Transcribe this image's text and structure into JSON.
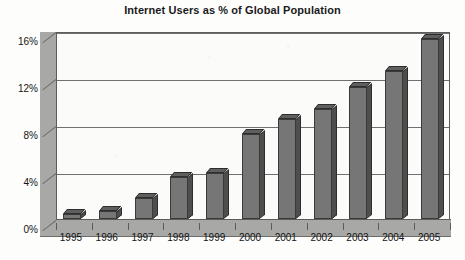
{
  "chart_data": {
    "type": "bar",
    "title": "Internet Users as % of Global Population",
    "xlabel": "",
    "ylabel": "",
    "categories": [
      "1995",
      "1996",
      "1997",
      "1998",
      "1999",
      "2000",
      "2001",
      "2002",
      "2003",
      "2004",
      "2005"
    ],
    "values": [
      0.4,
      0.7,
      1.8,
      3.6,
      3.9,
      7.2,
      8.5,
      9.4,
      11.2,
      12.6,
      15.3
    ],
    "ylim": [
      0,
      16
    ],
    "yticks": [
      0,
      4,
      8,
      12,
      16
    ],
    "ytick_labels": [
      "0%",
      "4%",
      "8%",
      "12%",
      "16%"
    ],
    "grid": true,
    "legend": false,
    "style": "3d-column",
    "colors": {
      "bar_front": "#767676",
      "bar_side": "#4e4e4e",
      "bar_top": "#5f5f5f",
      "wall": "#a8a8a6",
      "plot_background": "#fbfbfa",
      "gridline": "#707070",
      "axis": "#5c5c5c",
      "text": "#141414"
    }
  }
}
